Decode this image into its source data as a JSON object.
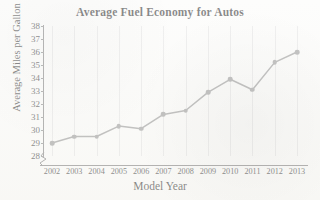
{
  "chart_data": {
    "type": "line",
    "title": "Average Fuel Economy for Autos",
    "xlabel": "Model Year",
    "ylabel": "Average Miles per Gallon",
    "categories": [
      "2002",
      "2003",
      "2004",
      "2005",
      "2006",
      "2007",
      "2008",
      "2009",
      "2010",
      "2011",
      "2012",
      "2013"
    ],
    "values": [
      29.0,
      29.5,
      29.5,
      30.3,
      30.1,
      31.2,
      31.5,
      32.9,
      33.9,
      33.1,
      35.2,
      36.0
    ],
    "x": [
      2002,
      2003,
      2004,
      2005,
      2006,
      2007,
      2008,
      2009,
      2010,
      2011,
      2012,
      2013
    ],
    "ylim": [
      28,
      38
    ],
    "xlim": [
      2002,
      2013
    ],
    "ytick_labels": [
      "38",
      "37",
      "36",
      "35",
      "34",
      "33",
      "32",
      "31",
      "30",
      "29",
      "28"
    ],
    "yticks": [
      38,
      37,
      36,
      35,
      34,
      33,
      32,
      31,
      30,
      29,
      28
    ],
    "grid": "vertical",
    "legend": "none",
    "axis_break": "y-axis break below 28",
    "series_color": "#8a8a8a",
    "marker": "circle",
    "units": "miles per gallon"
  },
  "colors": {
    "line": "#8a8a8a",
    "marker": "#8a8a8a",
    "axis": "#6f6f6f",
    "grid": "rgba(150,152,160,0.26)",
    "text": "#141414",
    "background": "#fbfbf9"
  },
  "icons": {
    "axis_break": "axis-break-zigzag-icon"
  }
}
